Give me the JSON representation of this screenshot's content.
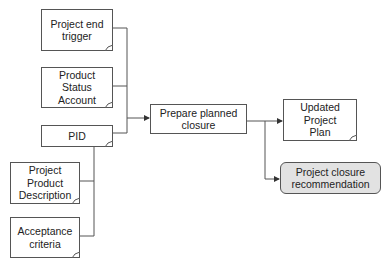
{
  "diagram": {
    "inputs": [
      {
        "id": "project-end-trigger",
        "label": "Project end\ntrigger"
      },
      {
        "id": "product-status-account",
        "label": "Product\nStatus\nAccount"
      },
      {
        "id": "pid",
        "label": "PID"
      },
      {
        "id": "project-product-description",
        "label": "Project\nProduct\nDescription"
      },
      {
        "id": "acceptance-criteria",
        "label": "Acceptance\ncriteria"
      }
    ],
    "process": {
      "id": "prepare-planned-closure",
      "label": "Prepare planned\nclosure"
    },
    "outputs": [
      {
        "id": "updated-project-plan",
        "label": "Updated\nProject\nPlan"
      },
      {
        "id": "project-closure-recommendation",
        "label": "Project closure\nrecommendation"
      }
    ],
    "colors": {
      "line": "#555555",
      "box_fill": "#ffffff",
      "highlight_fill": "#e2e2e2"
    }
  }
}
